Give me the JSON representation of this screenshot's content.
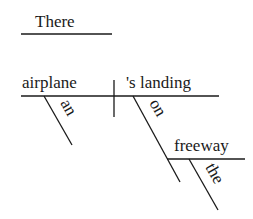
{
  "diagram": {
    "type": "sentence-diagram",
    "style": "Reed-Kellogg",
    "expletive": "There",
    "subject": "airplane",
    "predicate": "'s landing",
    "modifiers": {
      "subject_article": "an",
      "preposition": "on",
      "prepositional_object": "freeway",
      "object_article": "the"
    }
  }
}
